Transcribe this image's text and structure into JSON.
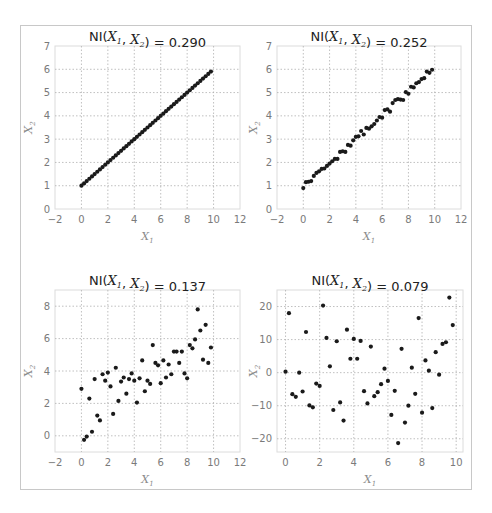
{
  "figure": {
    "header_text_cropped": ""
  },
  "chart_data": [
    {
      "type": "scatter",
      "title": "NI(X1, X2) = 0.290",
      "title_parts": {
        "prefix": "NI(",
        "var1": "X",
        "sub1": "1",
        "sep": ", ",
        "var2": "X",
        "sub2": "2",
        "suffix": ") = 0.290"
      },
      "xlabel": "X1",
      "ylabel": "X2",
      "xlim": [
        -2,
        12
      ],
      "ylim": [
        0,
        7
      ],
      "xticks": [
        -2,
        0,
        2,
        4,
        6,
        8,
        10,
        12
      ],
      "yticks": [
        0,
        1,
        2,
        3,
        4,
        5,
        6,
        7
      ],
      "grid": true,
      "generator": "y = 1 + 0.5x, 50 evenly spaced x from 0 to 9.8",
      "x": [
        0,
        0.2,
        0.4,
        0.6,
        0.8,
        1,
        1.2,
        1.4,
        1.6,
        1.8,
        2,
        2.2,
        2.4,
        2.6,
        2.8,
        3,
        3.2,
        3.4,
        3.6,
        3.8,
        4,
        4.2,
        4.4,
        4.6,
        4.8,
        5,
        5.2,
        5.4,
        5.6,
        5.8,
        6,
        6.2,
        6.4,
        6.6,
        6.8,
        7,
        7.2,
        7.4,
        7.6,
        7.8,
        8,
        8.2,
        8.4,
        8.6,
        8.8,
        9,
        9.2,
        9.4,
        9.6,
        9.8
      ],
      "y": [
        1,
        1.1,
        1.2,
        1.3,
        1.4,
        1.5,
        1.6,
        1.7,
        1.8,
        1.9,
        2,
        2.1,
        2.2,
        2.3,
        2.4,
        2.5,
        2.6,
        2.7,
        2.8,
        2.9,
        3,
        3.1,
        3.2,
        3.3,
        3.4,
        3.5,
        3.6,
        3.7,
        3.8,
        3.9,
        4,
        4.1,
        4.2,
        4.3,
        4.4,
        4.5,
        4.6,
        4.7,
        4.8,
        4.9,
        5,
        5.1,
        5.2,
        5.3,
        5.4,
        5.5,
        5.6,
        5.7,
        5.8,
        5.9
      ]
    },
    {
      "type": "scatter",
      "title": "NI(X1, X2) = 0.252",
      "title_parts": {
        "prefix": "NI(",
        "var1": "X",
        "sub1": "1",
        "sep": ", ",
        "var2": "X",
        "sub2": "2",
        "suffix": ") = 0.252"
      },
      "xlabel": "X1",
      "ylabel": "X2",
      "xlim": [
        -2,
        12
      ],
      "ylim": [
        0,
        7
      ],
      "xticks": [
        -2,
        0,
        2,
        4,
        6,
        8,
        10,
        12
      ],
      "yticks": [
        0,
        1,
        2,
        3,
        4,
        5,
        6,
        7
      ],
      "grid": true,
      "x": [
        0,
        0.2,
        0.4,
        0.6,
        0.8,
        1,
        1.2,
        1.4,
        1.6,
        1.8,
        2,
        2.2,
        2.4,
        2.6,
        2.8,
        3,
        3.2,
        3.4,
        3.6,
        3.8,
        4,
        4.2,
        4.4,
        4.6,
        4.8,
        5,
        5.2,
        5.4,
        5.6,
        5.8,
        6,
        6.2,
        6.4,
        6.6,
        6.8,
        7,
        7.2,
        7.4,
        7.6,
        7.8,
        8,
        8.2,
        8.4,
        8.6,
        8.8,
        9,
        9.2,
        9.4,
        9.6,
        9.8
      ],
      "y": [
        0.9,
        1.15,
        1.17,
        1.2,
        1.42,
        1.55,
        1.62,
        1.72,
        1.74,
        1.85,
        1.95,
        2.05,
        2.15,
        2.15,
        2.45,
        2.48,
        2.45,
        2.75,
        2.72,
        2.95,
        3.1,
        3.12,
        3.35,
        3.2,
        3.48,
        3.45,
        3.55,
        3.65,
        3.8,
        3.95,
        3.92,
        4.25,
        4.28,
        4.18,
        4.55,
        4.68,
        4.72,
        4.7,
        4.68,
        5.02,
        4.95,
        5.25,
        5.22,
        5.4,
        5.45,
        5.58,
        5.62,
        5.9,
        5.85,
        5.98
      ]
    },
    {
      "type": "scatter",
      "title": "NI(X1, X2) = 0.137",
      "title_parts": {
        "prefix": "NI(",
        "var1": "X",
        "sub1": "1",
        "sep": ", ",
        "var2": "X",
        "sub2": "2",
        "suffix": ") = 0.137"
      },
      "xlabel": "X1",
      "ylabel": "X2",
      "xlim": [
        -2,
        12
      ],
      "ylim": [
        -1,
        9
      ],
      "xticks": [
        -2,
        0,
        2,
        4,
        6,
        8,
        10,
        12
      ],
      "yticks": [
        0,
        2,
        4,
        6,
        8
      ],
      "grid": true,
      "x": [
        0,
        0.2,
        0.4,
        0.6,
        0.8,
        1,
        1.2,
        1.4,
        1.6,
        1.8,
        2,
        2.2,
        2.4,
        2.6,
        2.8,
        3,
        3.2,
        3.4,
        3.6,
        3.8,
        4,
        4.2,
        4.4,
        4.6,
        4.8,
        5,
        5.2,
        5.4,
        5.6,
        5.8,
        6,
        6.2,
        6.4,
        6.6,
        6.8,
        7,
        7.2,
        7.4,
        7.6,
        7.8,
        8,
        8.2,
        8.4,
        8.6,
        8.8,
        9,
        9.2,
        9.4,
        9.6,
        9.8
      ],
      "y": [
        2.9,
        -0.25,
        -0.05,
        2.3,
        0.25,
        3.5,
        1.25,
        0.95,
        3.8,
        3.4,
        3.9,
        3.05,
        1.35,
        4.2,
        2.15,
        3.35,
        3.6,
        2.6,
        3.5,
        3.85,
        3.4,
        2.05,
        3.55,
        4.65,
        2.75,
        3.4,
        3.2,
        5.6,
        4.5,
        4.35,
        3.25,
        4.65,
        3.6,
        4.4,
        3.8,
        5.2,
        5.2,
        4.5,
        5.2,
        3.85,
        3.55,
        5.6,
        5.4,
        5.95,
        7.8,
        6.5,
        4.7,
        6.85,
        4.5,
        5.45
      ]
    },
    {
      "type": "scatter",
      "title": "NI(X1, X2) = 0.079",
      "title_parts": {
        "prefix": "NI(",
        "var1": "X",
        "sub1": "1",
        "sep": ", ",
        "var2": "X",
        "sub2": "2",
        "suffix": ") = 0.079"
      },
      "xlabel": "X1",
      "ylabel": "X2",
      "xlim": [
        -0.5,
        10.4
      ],
      "ylim": [
        -24,
        25
      ],
      "xticks": [
        0,
        2,
        4,
        6,
        8,
        10
      ],
      "yticks": [
        -20,
        -10,
        0,
        10,
        20
      ],
      "grid": true,
      "x": [
        0,
        0.2,
        0.4,
        0.6,
        0.8,
        1,
        1.2,
        1.4,
        1.6,
        1.8,
        2,
        2.2,
        2.4,
        2.6,
        2.8,
        3,
        3.2,
        3.4,
        3.6,
        3.8,
        4,
        4.2,
        4.4,
        4.6,
        4.8,
        5,
        5.2,
        5.4,
        5.6,
        5.8,
        6,
        6.2,
        6.4,
        6.6,
        6.8,
        7,
        7.2,
        7.4,
        7.6,
        7.8,
        8,
        8.2,
        8.4,
        8.6,
        8.8,
        9,
        9.2,
        9.4,
        9.6,
        9.8
      ],
      "y": [
        0.3,
        18,
        -6.5,
        -7.3,
        0,
        -5.7,
        12.3,
        -9.9,
        -10.5,
        -3.3,
        -4,
        20.3,
        10.5,
        1.9,
        -11.3,
        9.5,
        -9,
        -14.5,
        13,
        4.2,
        10.2,
        4.2,
        9.6,
        -5.6,
        -9.3,
        7.9,
        -7.1,
        -5.9,
        -3.5,
        1.2,
        -2.5,
        -12.8,
        -5.5,
        -21.3,
        7.2,
        -15.1,
        -10,
        1.5,
        -6.4,
        16.5,
        -12.1,
        3.7,
        0.6,
        -10.7,
        6.2,
        -0.6,
        8.7,
        9.2,
        22.7,
        14.4
      ]
    }
  ]
}
